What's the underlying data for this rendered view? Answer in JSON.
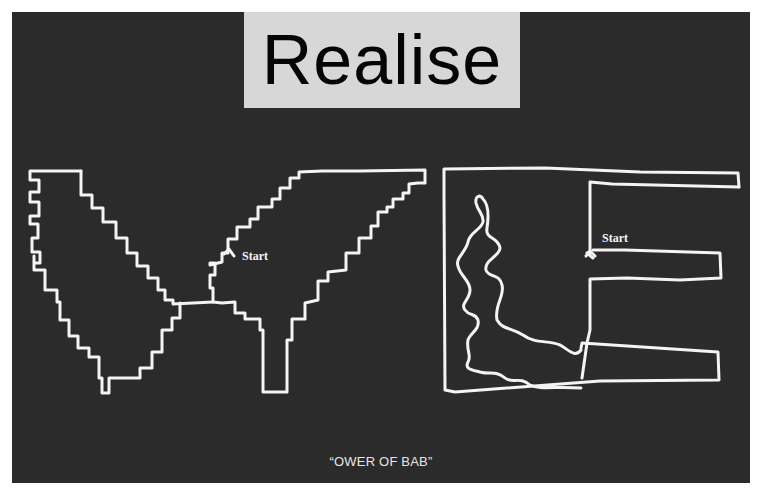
{
  "figure": {
    "title_label": "Realise",
    "caption": "“OWER OF BAB”",
    "colors": {
      "panel_background": "#2b2b2b",
      "label_background": "#d7d7d7",
      "label_text": "#050505",
      "stroke": "#f4f4f4",
      "page_background": "#ffffff"
    }
  },
  "drawings": {
    "left": {
      "shape": "stepped-V",
      "start_label": "Start",
      "start_marker": "arrow-up-icon"
    },
    "right": {
      "shape": "E-with-wiggle",
      "start_label": "Start",
      "start_marker": "fork-icon"
    }
  }
}
